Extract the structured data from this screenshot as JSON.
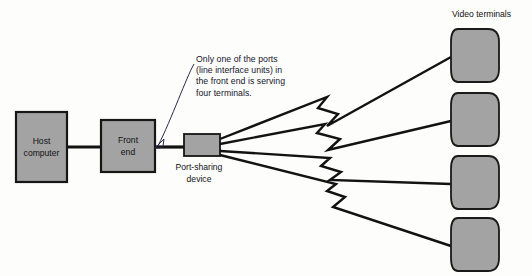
{
  "diagram": {
    "background_color": "#fdfdfc",
    "node_fill_color": "#a3a3a3",
    "node_stroke_color": "#161616",
    "line_color": "#121212",
    "nodes": [
      {
        "id": "host-computer",
        "label_line1": "Host",
        "label_line2": "computer"
      },
      {
        "id": "front-end",
        "label_line1": "Front",
        "label_line2": "end"
      },
      {
        "id": "port-sharing-device",
        "label_line1": "Port-sharing",
        "label_line2": "device"
      }
    ],
    "terminals": {
      "group_label": "Video terminals",
      "count": 4,
      "items": [
        {
          "id": "video-terminal-1"
        },
        {
          "id": "video-terminal-2"
        },
        {
          "id": "video-terminal-3"
        },
        {
          "id": "video-terminal-4"
        }
      ]
    },
    "annotation": {
      "target": "front-end",
      "lines": [
        "Only one of the ports",
        "(line interface units) in",
        "the front end is serving",
        "four terminals."
      ]
    }
  }
}
